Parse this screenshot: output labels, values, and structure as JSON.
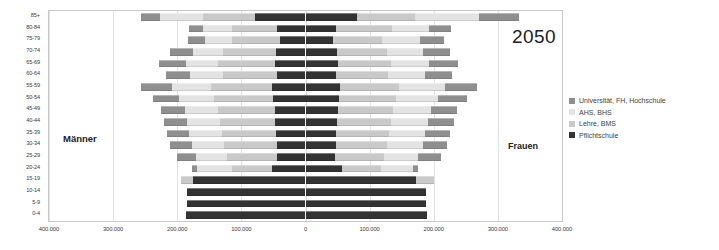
{
  "chart_data": {
    "type": "bar",
    "subtype": "population-pyramid-stacked",
    "title": "",
    "year_annotation": "2050",
    "left_side_label": "Männer",
    "right_side_label": "Frauen",
    "xlabel": "",
    "ylabel": "",
    "xlim": [
      -400000,
      400000
    ],
    "grid": true,
    "legend_position": "right",
    "x_ticks": [
      {
        "value": -400000,
        "label": "400.000"
      },
      {
        "value": -300000,
        "label": "300.000"
      },
      {
        "value": -200000,
        "label": "200.000"
      },
      {
        "value": -100000,
        "label": "100.000"
      },
      {
        "value": 0,
        "label": "0"
      },
      {
        "value": 100000,
        "label": "100.000"
      },
      {
        "value": 200000,
        "label": "200.000"
      },
      {
        "value": 300000,
        "label": "300.000"
      },
      {
        "value": 400000,
        "label": "400.000"
      }
    ],
    "categories": [
      "85+",
      "80-84",
      "75-79",
      "70-74",
      "65-69",
      "60-64",
      "55-59",
      "50-54",
      "45-49",
      "40-44",
      "35-39",
      "30-34",
      "25-29",
      "20-24",
      "15-19",
      "10-14",
      "5-9",
      "0-4"
    ],
    "series": [
      {
        "name": "Pflichtschule",
        "color": "#333333",
        "order": 1
      },
      {
        "name": "Lehre, BMS",
        "color": "#c9c9c9",
        "order": 2
      },
      {
        "name": "AHS, BHS",
        "color": "#e3e3e3",
        "order": 3
      },
      {
        "name": "Universität, FH, Hochschule",
        "color": "#8f8f8f",
        "order": 4
      }
    ],
    "legend_entries": [
      {
        "label": "Universität, FH, Hochschule",
        "color": "#8f8f8f"
      },
      {
        "label": "AHS, BHS",
        "color": "#e3e3e3"
      },
      {
        "label": "Lehre, BMS",
        "color": "#c9c9c9"
      },
      {
        "label": "Pflichtschule",
        "color": "#333333"
      }
    ],
    "rows": [
      {
        "age": "85+",
        "male": {
          "uni": 30000,
          "ahs": 67000,
          "lehre": 82000,
          "pflicht": 78000
        },
        "female": {
          "pflicht": 80000,
          "lehre": 90000,
          "ahs": 101000,
          "uni": 62000
        }
      },
      {
        "age": "80-84",
        "male": {
          "uni": 22000,
          "ahs": 45000,
          "lehre": 70000,
          "pflicht": 45000
        },
        "female": {
          "pflicht": 47000,
          "lehre": 88000,
          "ahs": 57000,
          "uni": 35000
        }
      },
      {
        "age": "75-79",
        "male": {
          "uni": 26000,
          "ahs": 43000,
          "lehre": 74000,
          "pflicht": 40000
        },
        "female": {
          "pflicht": 43000,
          "lehre": 77000,
          "ahs": 58000,
          "uni": 38000
        }
      },
      {
        "age": "70-74",
        "male": {
          "uni": 36000,
          "ahs": 46000,
          "lehre": 83000,
          "pflicht": 46000
        },
        "female": {
          "pflicht": 49000,
          "lehre": 78000,
          "ahs": 57000,
          "uni": 42000
        }
      },
      {
        "age": "65-69",
        "male": {
          "uni": 43000,
          "ahs": 50000,
          "lehre": 88000,
          "pflicht": 48000
        },
        "female": {
          "pflicht": 51000,
          "lehre": 83000,
          "ahs": 59000,
          "uni": 45000
        }
      },
      {
        "age": "60-64",
        "male": {
          "uni": 38000,
          "ahs": 51000,
          "lehre": 84000,
          "pflicht": 45000
        },
        "female": {
          "pflicht": 48000,
          "lehre": 80000,
          "ahs": 58000,
          "uni": 43000
        }
      },
      {
        "age": "55-59",
        "male": {
          "uni": 48000,
          "ahs": 60000,
          "lehre": 96000,
          "pflicht": 52000
        },
        "female": {
          "pflicht": 54000,
          "lehre": 92000,
          "ahs": 72000,
          "uni": 50000
        }
      },
      {
        "age": "50-54",
        "male": {
          "uni": 40000,
          "ahs": 55000,
          "lehre": 93000,
          "pflicht": 50000
        },
        "female": {
          "pflicht": 52000,
          "lehre": 89000,
          "ahs": 65000,
          "uni": 46000
        }
      },
      {
        "age": "45-49",
        "male": {
          "uni": 37000,
          "ahs": 52000,
          "lehre": 88000,
          "pflicht": 48000
        },
        "female": {
          "pflicht": 50000,
          "lehre": 86000,
          "ahs": 60000,
          "uni": 41000
        }
      },
      {
        "age": "40-44",
        "male": {
          "uni": 36000,
          "ahs": 52000,
          "lehre": 86000,
          "pflicht": 47000
        },
        "female": {
          "pflicht": 49000,
          "lehre": 84000,
          "ahs": 58000,
          "uni": 40000
        }
      },
      {
        "age": "35-39",
        "male": {
          "uni": 35000,
          "ahs": 51000,
          "lehre": 84000,
          "pflicht": 46000
        },
        "female": {
          "pflicht": 48000,
          "lehre": 82000,
          "ahs": 57000,
          "uni": 39000
        }
      },
      {
        "age": "30-34",
        "male": {
          "uni": 34000,
          "ahs": 50000,
          "lehre": 82000,
          "pflicht": 45000
        },
        "female": {
          "pflicht": 47000,
          "lehre": 80000,
          "ahs": 56000,
          "uni": 38000
        }
      },
      {
        "age": "25-29",
        "male": {
          "uni": 31000,
          "ahs": 48000,
          "lehre": 78000,
          "pflicht": 44000
        },
        "female": {
          "pflicht": 46000,
          "lehre": 76000,
          "ahs": 54000,
          "uni": 36000
        }
      },
      {
        "age": "20-24",
        "male": {
          "uni": 8000,
          "ahs": 54000,
          "lehre": 62000,
          "pflicht": 53000
        },
        "female": {
          "pflicht": 57000,
          "lehre": 60000,
          "ahs": 50000,
          "uni": 8000
        }
      },
      {
        "age": "15-19",
        "male": {
          "uni": 0,
          "ahs": 0,
          "lehre": 18000,
          "pflicht": 176000
        },
        "female": {
          "pflicht": 173000,
          "lehre": 28000,
          "ahs": 0,
          "uni": 0
        }
      },
      {
        "age": "10-14",
        "male": {
          "uni": 0,
          "ahs": 0,
          "lehre": 0,
          "pflicht": 185000
        },
        "female": {
          "pflicht": 188000,
          "lehre": 0,
          "ahs": 0,
          "uni": 0
        }
      },
      {
        "age": "5-9",
        "male": {
          "uni": 0,
          "ahs": 0,
          "lehre": 0,
          "pflicht": 185000
        },
        "female": {
          "pflicht": 188000,
          "lehre": 0,
          "ahs": 0,
          "uni": 0
        }
      },
      {
        "age": "0-4",
        "male": {
          "uni": 0,
          "ahs": 0,
          "lehre": 0,
          "pflicht": 187000
        },
        "female": {
          "pflicht": 190000,
          "lehre": 0,
          "ahs": 0,
          "uni": 0
        }
      }
    ]
  }
}
